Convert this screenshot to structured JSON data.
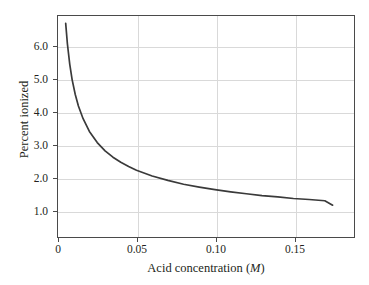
{
  "chart_data": {
    "type": "line",
    "title": "",
    "xlabel": "Acid concentration (M)",
    "xlabel_text": "Acid concentration (",
    "xlabel_unit": "M",
    "xlabel_close": ")",
    "ylabel": "Percent ionized",
    "xlim": [
      0,
      0.1886
    ],
    "ylim": [
      0.0,
      6.95
    ],
    "xticks": [
      0,
      0.05,
      0.1,
      0.15
    ],
    "xticklabels": [
      "0",
      "0.05",
      "0.10",
      "0.15"
    ],
    "yticks": [
      1.0,
      2.0,
      3.0,
      4.0,
      5.0,
      6.0
    ],
    "yticklabels": [
      "1.0",
      "2.0",
      "3.0",
      "4.0",
      "5.0",
      "6.0"
    ],
    "grid": "both",
    "legend": "none",
    "series": [
      {
        "name": "percent ionized",
        "relation": "percent = 0.470 / sqrt(concentration)",
        "x": [
          0.0049,
          0.006,
          0.0075,
          0.009,
          0.011,
          0.013,
          0.016,
          0.02,
          0.025,
          0.03,
          0.035,
          0.04,
          0.045,
          0.05,
          0.06,
          0.07,
          0.08,
          0.09,
          0.1,
          0.11,
          0.12,
          0.13,
          0.14,
          0.15,
          0.16,
          0.17,
          0.175
        ],
        "y": [
          6.72,
          6.07,
          5.43,
          4.95,
          4.48,
          4.12,
          3.72,
          3.32,
          2.97,
          2.71,
          2.51,
          2.35,
          2.22,
          2.1,
          1.92,
          1.78,
          1.66,
          1.57,
          1.49,
          1.42,
          1.36,
          1.3,
          1.26,
          1.21,
          1.18,
          1.14,
          1.0
        ]
      }
    ],
    "colors": {
      "curve": "#3a3a3a",
      "frame": "#4a4a4a",
      "grid": "#d9d9d9",
      "text": "#231f20",
      "background": "#ffffff"
    }
  }
}
